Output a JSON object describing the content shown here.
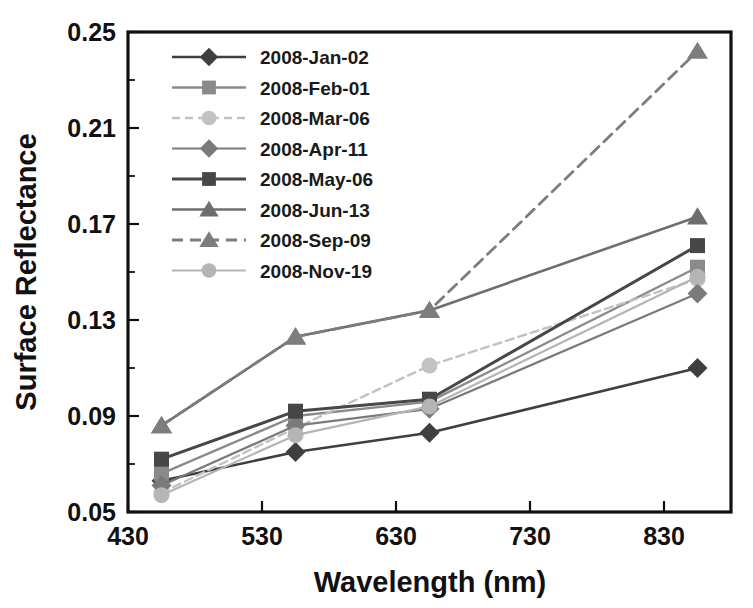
{
  "chart_data": {
    "type": "line",
    "title": "",
    "xlabel": "Wavelength (nm)",
    "ylabel": "Surface Reflectance",
    "xlim": [
      430,
      880
    ],
    "ylim": [
      0.05,
      0.25
    ],
    "xticks": [
      430,
      530,
      630,
      730,
      830
    ],
    "xtick_labels": [
      "430",
      "530",
      "630",
      "730",
      "830"
    ],
    "yticks": [
      0.05,
      0.09,
      0.13,
      0.17,
      0.21,
      0.25
    ],
    "ytick_labels": [
      "0.05",
      "0.09",
      "0.13",
      "0.17",
      "0.21",
      "0.25"
    ],
    "yticks_minor": [
      0.07,
      0.11,
      0.15,
      0.19,
      0.23
    ],
    "grid": false,
    "legend_position": "top-left",
    "x": [
      455,
      555,
      655,
      855
    ],
    "series": [
      {
        "name": "2008-Jan-02",
        "values": [
          0.063,
          0.075,
          0.083,
          0.11
        ],
        "color": "#3f3f3f",
        "marker": "diamond",
        "dash": "none",
        "width": 2.6
      },
      {
        "name": "2008-Feb-01",
        "values": [
          0.066,
          0.09,
          0.096,
          0.152
        ],
        "color": "#8a8a8a",
        "marker": "square",
        "dash": "none",
        "width": 2.4
      },
      {
        "name": "2008-Mar-06",
        "values": [
          0.058,
          0.085,
          0.111,
          0.147
        ],
        "color": "#c2c2c2",
        "marker": "circle",
        "dash": "8,5",
        "width": 2.4
      },
      {
        "name": "2008-Apr-11",
        "values": [
          0.061,
          0.086,
          0.093,
          0.141
        ],
        "color": "#7a7a7a",
        "marker": "diamond",
        "dash": "none",
        "width": 2.2
      },
      {
        "name": "2008-May-06",
        "values": [
          0.072,
          0.092,
          0.097,
          0.161
        ],
        "color": "#474747",
        "marker": "square",
        "dash": "none",
        "width": 3.0
      },
      {
        "name": "2008-Jun-13",
        "values": [
          0.086,
          0.123,
          0.134,
          0.173
        ],
        "color": "#6e6e6e",
        "marker": "triangle",
        "dash": "none",
        "width": 2.6
      },
      {
        "name": "2008-Sep-09",
        "values": [
          0.086,
          0.123,
          0.134,
          0.242
        ],
        "color": "#7d7d7d",
        "marker": "triangle",
        "dash": "11,7",
        "width": 2.8
      },
      {
        "name": "2008-Nov-19",
        "values": [
          0.057,
          0.082,
          0.094,
          0.148
        ],
        "color": "#b5b5b5",
        "marker": "circle",
        "dash": "none",
        "width": 2.2
      }
    ]
  },
  "legend": {
    "entries": [
      "2008-Jan-02",
      "2008-Feb-01",
      "2008-Mar-06",
      "2008-Apr-11",
      "2008-May-06",
      "2008-Jun-13",
      "2008-Sep-09",
      "2008-Nov-19"
    ]
  },
  "axes": {
    "x_title": "Wavelength (nm)",
    "y_title": "Surface Reflectance"
  }
}
